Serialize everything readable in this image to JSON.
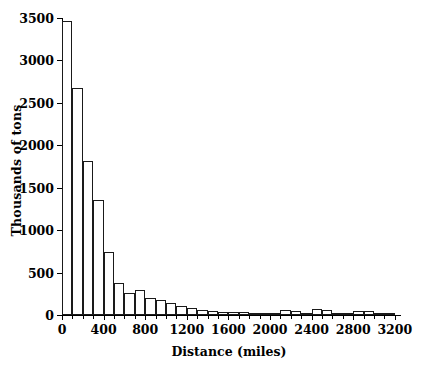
{
  "chart_data": {
    "type": "bar",
    "title": "",
    "subtitle": "",
    "xlabel": "Distance (miles)",
    "ylabel": "Thousands of tons",
    "xlim": [
      0,
      3250
    ],
    "ylim": [
      0,
      3500
    ],
    "bin_width": 100,
    "grid": false,
    "legend": null,
    "annotations": [],
    "xticks": [
      0,
      400,
      800,
      1200,
      1600,
      2000,
      2400,
      2800,
      3200
    ],
    "xtick_labels": [
      "0",
      "400",
      "800",
      "1200",
      "1600",
      "2000",
      "2400",
      "2800",
      "3200"
    ],
    "xminor_step": 100,
    "yticks": [
      0,
      500,
      1000,
      1500,
      2000,
      2500,
      3000,
      3500
    ],
    "ytick_labels": [
      "0",
      "500",
      "1000",
      "1500",
      "2000",
      "2500",
      "3000",
      "3500"
    ],
    "categories": [
      "0-100",
      "100-200",
      "200-300",
      "300-400",
      "400-500",
      "500-600",
      "600-700",
      "700-800",
      "800-900",
      "900-1000",
      "1000-1100",
      "1100-1200",
      "1200-1300",
      "1300-1400",
      "1400-1500",
      "1500-1600",
      "1600-1700",
      "1700-1800",
      "1800-1900",
      "1900-2000",
      "2000-2100",
      "2100-2200",
      "2200-2300",
      "2300-2400",
      "2400-2500",
      "2500-2600",
      "2600-2700",
      "2700-2800",
      "2800-2900",
      "2900-3000",
      "3000-3100",
      "3100-3200"
    ],
    "bin_starts": [
      0,
      100,
      200,
      300,
      400,
      500,
      600,
      700,
      800,
      900,
      1000,
      1100,
      1200,
      1300,
      1400,
      1500,
      1600,
      1700,
      1800,
      1900,
      2000,
      2100,
      2200,
      2300,
      2400,
      2500,
      2600,
      2700,
      2800,
      2900,
      3000,
      3100
    ],
    "values": [
      3460,
      2670,
      1820,
      1355,
      745,
      375,
      255,
      295,
      195,
      175,
      145,
      105,
      80,
      55,
      45,
      40,
      30,
      30,
      25,
      25,
      20,
      55,
      45,
      25,
      65,
      55,
      25,
      20,
      45,
      45,
      20,
      10
    ]
  },
  "axis_colors": {
    "axis": "#000000",
    "bar_edge": "#1a1a1a",
    "bar_face": "#ffffff",
    "background": "#ffffff"
  }
}
